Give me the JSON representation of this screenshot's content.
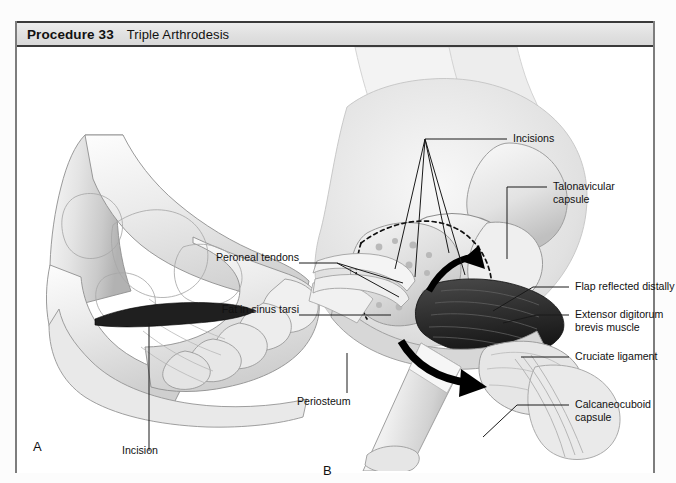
{
  "header": {
    "procedure_number": "Procedure 33",
    "procedure_title": "Triple Arthrodesis"
  },
  "figure": {
    "panels": [
      {
        "letter": "A",
        "caption": "Lateral view of foot with skin incision marked"
      },
      {
        "letter": "B",
        "caption": "Surgical exposure of the subtalar, talonavicular and calcaneocuboid joints"
      }
    ],
    "panel_a_labels": [
      {
        "id": "incision",
        "text": "Incision"
      }
    ],
    "panel_b_labels_left": [
      {
        "id": "peroneal-tendons",
        "text": "Peroneal tendons"
      },
      {
        "id": "fat-in-sinus-tarsi",
        "text": "Fat in sinus tarsi"
      },
      {
        "id": "periosteum",
        "text": "Periosteum"
      }
    ],
    "panel_b_labels_right": [
      {
        "id": "incisions",
        "text": "Incisions"
      },
      {
        "id": "talonavicular-capsule",
        "text": "Talonavicular\ncapsule"
      },
      {
        "id": "flap-reflected-distally",
        "text": "Flap reflected distally"
      },
      {
        "id": "extensor-digitorum-brevis-muscle",
        "text": "Extensor digitorum\nbrevis muscle"
      },
      {
        "id": "cruciate-ligament",
        "text": "Cruciate ligament"
      },
      {
        "id": "calcaneocuboid-capsule",
        "text": "Calcaneocuboid\ncapsule"
      }
    ]
  },
  "colors": {
    "page_background": "#fbfbfb",
    "plate_background": "#ffffff",
    "title_band_background": "#e3e3e3",
    "title_band_border": "#3a3a3a",
    "plate_border": "#7d7d7d",
    "label_text": "#111111",
    "leader_line": "#1a1a1a",
    "anatomy_light": "#ececec",
    "anatomy_mid": "#c9c9c9",
    "anatomy_shadow": "#9a9a9a",
    "anatomy_dark": "#3c3c3c",
    "incision_dark": "#2b2b2b"
  }
}
